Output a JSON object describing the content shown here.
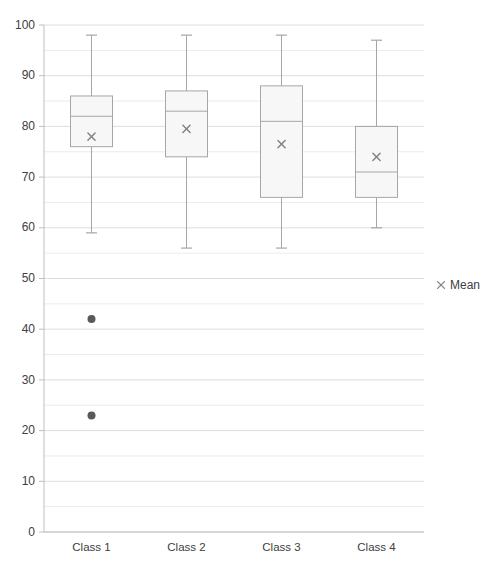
{
  "chart_data": {
    "type": "box",
    "title": "",
    "xlabel": "",
    "ylabel": "",
    "ylim": [
      0,
      100
    ],
    "ytick_step": 10,
    "minor_grid_step": 5,
    "grid": true,
    "legend_position": "right",
    "categories": [
      "Class 1",
      "Class 2",
      "Class 3",
      "Class 4"
    ],
    "legend": [
      {
        "label": "Mean",
        "marker": "x",
        "color": "#808080"
      }
    ],
    "series": [
      {
        "name": "Box",
        "boxes": [
          {
            "category": "Class 1",
            "whisker_low": 59,
            "q1": 76,
            "median": 82,
            "q3": 86,
            "whisker_high": 98,
            "mean": 78,
            "outliers": [
              42,
              23
            ]
          },
          {
            "category": "Class 2",
            "whisker_low": 56,
            "q1": 74,
            "median": 83,
            "q3": 87,
            "whisker_high": 98,
            "mean": 79.5,
            "outliers": []
          },
          {
            "category": "Class 3",
            "whisker_low": 56,
            "q1": 66,
            "median": 81,
            "q3": 88,
            "whisker_high": 98,
            "mean": 76.5,
            "outliers": []
          },
          {
            "category": "Class 4",
            "whisker_low": 60,
            "q1": 66,
            "median": 71,
            "q3": 80,
            "whisker_high": 97,
            "mean": 74,
            "outliers": []
          }
        ]
      }
    ],
    "ytick_labels": [
      "100",
      "90",
      "80",
      "70",
      "60",
      "50",
      "40",
      "30",
      "20",
      "10",
      "0"
    ],
    "colors": {
      "box_fill": "#f7f7f7",
      "box_stroke": "#a6a6a6",
      "whisker_stroke": "#a6a6a6",
      "grid": "#d9d9d9",
      "axis": "#bfbfbf",
      "outlier": "#595959",
      "mean_marker": "#808080",
      "text": "#404040"
    }
  }
}
